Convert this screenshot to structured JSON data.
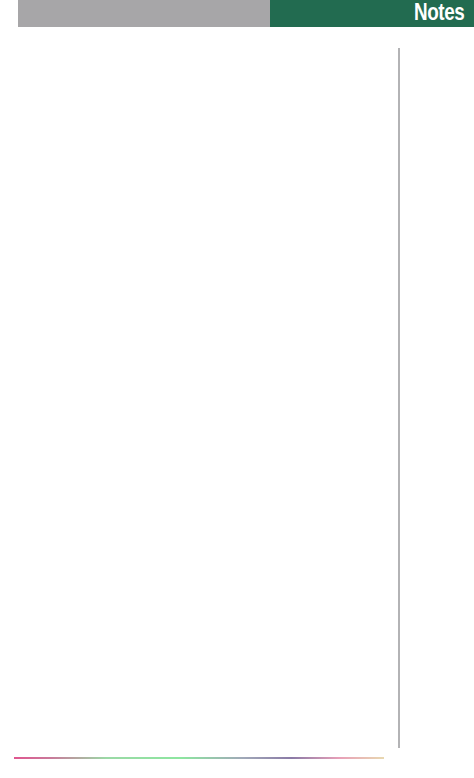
{
  "header": {
    "title": "Notes",
    "colors": {
      "gray_band": "#a7a6a8",
      "green_band": "#226b50",
      "title_text": "#ffffff"
    }
  },
  "page": {
    "rules": {
      "vertical_color": "#b3b3b5",
      "bottom_gradient": [
        "#e0568f",
        "#8de6a0",
        "#8a7aa6",
        "#e8d8b0"
      ]
    },
    "notes_content": ""
  }
}
